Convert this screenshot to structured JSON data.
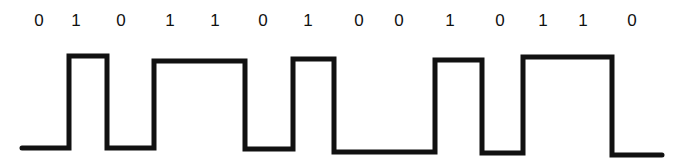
{
  "diagram": {
    "type": "digital-signal-waveform",
    "bits": [
      {
        "label": "0",
        "x": 39
      },
      {
        "label": "1",
        "x": 76
      },
      {
        "label": "0",
        "x": 121
      },
      {
        "label": "1",
        "x": 170
      },
      {
        "label": "1",
        "x": 215
      },
      {
        "label": "0",
        "x": 263
      },
      {
        "label": "1",
        "x": 308
      },
      {
        "label": "0",
        "x": 359
      },
      {
        "label": "0",
        "x": 399
      },
      {
        "label": "1",
        "x": 450
      },
      {
        "label": "0",
        "x": 500
      },
      {
        "label": "1",
        "x": 543
      },
      {
        "label": "1",
        "x": 583
      },
      {
        "label": "0",
        "x": 632
      }
    ],
    "waveform_points": "22,148 69,148 69,56 107,56 107,148 154,148 154,61 245,61 245,149 293,149 293,59 334,59 334,152 435,152 435,60 482,60 482,153 523,153 523,57 612,57 612,155 662,155",
    "line_color": "#111111",
    "line_width": 5
  }
}
